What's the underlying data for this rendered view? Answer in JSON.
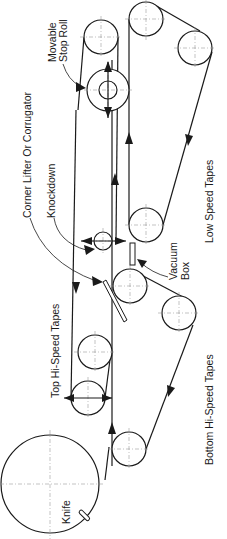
{
  "diagram": {
    "type": "machine-schematic",
    "orientation": "rotated-90",
    "colors": {
      "line": "#1a1a1a",
      "centerline": "#9a9a9a",
      "background": "#ffffff"
    },
    "labels": {
      "knife": "Knife",
      "top_hi_speed_tapes": "Top Hi-Speed Tapes",
      "bottom_hi_speed_tapes": "Bottom Hi-Speed Tapes",
      "corner_lifter": "Corner Lifter Or Corrugator",
      "knockdown": "Knockdown",
      "vacuum_box_line1": "Vacuum",
      "vacuum_box_line2": "Box",
      "low_speed_tapes": "Low Speed Tapes",
      "movable_stop_roll_line1": "Movable",
      "movable_stop_roll_line2": "Stop Roll"
    },
    "components": [
      {
        "id": "knife-cylinder",
        "shape": "circle"
      },
      {
        "id": "top-hi-speed-rolls",
        "count": 2
      },
      {
        "id": "bottom-hi-speed-rolls",
        "count": 3
      },
      {
        "id": "corner-lifter-blade"
      },
      {
        "id": "knockdown-roll"
      },
      {
        "id": "vacuum-box"
      },
      {
        "id": "low-speed-rolls",
        "count": 4
      },
      {
        "id": "movable-stop-roll"
      }
    ]
  }
}
